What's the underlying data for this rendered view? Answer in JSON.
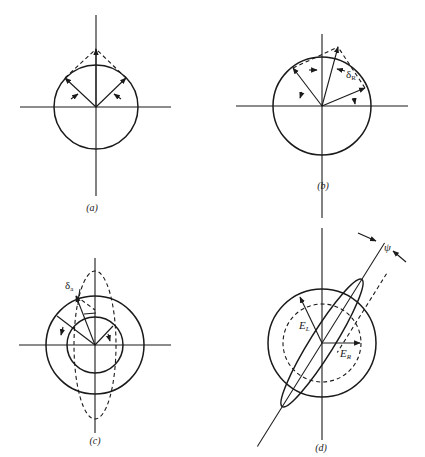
{
  "figure": {
    "panels": [
      {
        "id": "a",
        "label": "(a)"
      },
      {
        "id": "b",
        "label": "(b)",
        "annotations": {
          "delta": "δ",
          "delta_sub": "R"
        }
      },
      {
        "id": "c",
        "label": "(c)",
        "annotations": {
          "delta": "δ",
          "delta_sub": "a"
        }
      },
      {
        "id": "d",
        "label": "(d)",
        "annotations": {
          "E_left": "E",
          "E_left_sub": "L",
          "E_right": "E",
          "E_right_sub": "R",
          "psi": "ψ"
        }
      }
    ]
  }
}
